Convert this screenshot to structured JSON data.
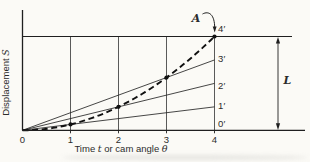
{
  "figure": {
    "background": "#fbfaf6",
    "ink": "#1f1f1f",
    "grid_color": "#3c3c3c",
    "text_color": "#2b2b2b"
  },
  "chart_data": {
    "type": "line",
    "title": "",
    "xlabel_parts": [
      {
        "text": "Time ",
        "italic": false
      },
      {
        "text": "t",
        "italic": true
      },
      {
        "text": " or cam angle ",
        "italic": false
      },
      {
        "text": "θ",
        "italic": true
      }
    ],
    "ylabel_parts": [
      {
        "text": "Displacement ",
        "italic": false
      },
      {
        "text": "S",
        "italic": true
      }
    ],
    "x_ticks": [
      "0",
      "1",
      "2",
      "3",
      "4"
    ],
    "x_range": [
      0,
      4
    ],
    "y_range_normalized": [
      0,
      1
    ],
    "grid": "vertical-gridlines-at-each-x-division",
    "legend": "none",
    "max_displacement_reference_line": 1,
    "series": [
      {
        "name": "construction-line-to-1-prime",
        "style": "solid-thin",
        "points": [
          [
            0,
            0
          ],
          [
            4,
            0.25
          ]
        ]
      },
      {
        "name": "construction-line-to-2-prime",
        "style": "solid-thin",
        "points": [
          [
            0,
            0
          ],
          [
            4,
            0.5
          ]
        ]
      },
      {
        "name": "construction-line-to-3-prime",
        "style": "solid-thin",
        "points": [
          [
            0,
            0
          ],
          [
            4,
            0.75
          ]
        ]
      },
      {
        "name": "displacement-curve-A",
        "style": "dashed-bold-parabola",
        "points": [
          [
            0,
            0
          ],
          [
            1,
            0.0625
          ],
          [
            2,
            0.25
          ],
          [
            3,
            0.5625
          ],
          [
            4,
            1
          ]
        ]
      }
    ],
    "marker_points_x": [
      1,
      2,
      3,
      4
    ],
    "right_labels": [
      "0′",
      "1′",
      "2′",
      "3′",
      "4′"
    ],
    "annotations": {
      "curve_label": "A",
      "curve_label_target": [
        4,
        1
      ],
      "rise_dimension_label": "L",
      "rise_dimension_span_normalized": [
        0,
        1
      ]
    }
  }
}
